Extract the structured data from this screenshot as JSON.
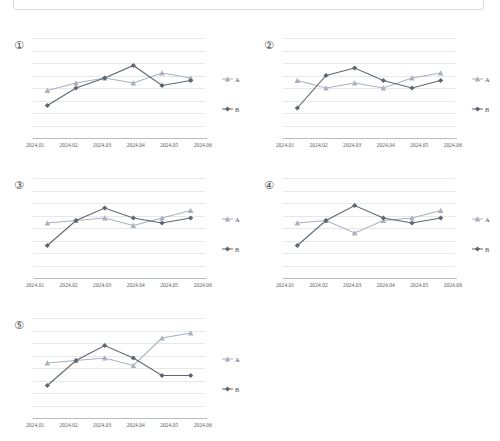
{
  "page": {
    "background": "#ffffff",
    "top_panel": {
      "name": "cropped-panel"
    }
  },
  "legend": {
    "series_a_label": "A",
    "series_b_label": "B"
  },
  "colors": {
    "series_a": "#a9b1bd",
    "series_b": "#5e6671",
    "gridline": "#e6e8ea",
    "axis": "#b9bcc0",
    "text": "#56565a"
  },
  "chart_data": [
    {
      "id": "chart-1",
      "index_label": "①",
      "type": "line",
      "title": "",
      "xlabel": "",
      "ylabel": "",
      "grid": true,
      "legend_position": "right",
      "categories": [
        "2024.01",
        "2024.02",
        "2024.03",
        "2024.04",
        "2024.05",
        "2024.06"
      ],
      "ylim": [
        0,
        100
      ],
      "series": [
        {
          "name": "A",
          "marker": "triangle",
          "values": [
            74,
            77,
            79,
            77,
            81,
            79
          ]
        },
        {
          "name": "B",
          "marker": "diamond",
          "values": [
            68,
            75,
            79,
            84,
            76,
            78
          ]
        }
      ]
    },
    {
      "id": "chart-2",
      "index_label": "②",
      "type": "line",
      "title": "",
      "xlabel": "",
      "ylabel": "",
      "grid": true,
      "legend_position": "right",
      "categories": [
        "2024.01",
        "2024.02",
        "2024.03",
        "2024.04",
        "2024.05",
        "2024.06"
      ],
      "ylim": [
        0,
        100
      ],
      "series": [
        {
          "name": "A",
          "marker": "triangle",
          "values": [
            78,
            75,
            77,
            75,
            79,
            81
          ]
        },
        {
          "name": "B",
          "marker": "diamond",
          "values": [
            67,
            80,
            83,
            78,
            75,
            78
          ]
        }
      ]
    },
    {
      "id": "chart-3",
      "index_label": "③",
      "type": "line",
      "title": "",
      "xlabel": "",
      "ylabel": "",
      "grid": true,
      "legend_position": "right",
      "categories": [
        "2024.01",
        "2024.02",
        "2024.03",
        "2024.04",
        "2024.05",
        "2024.06"
      ],
      "ylim": [
        0,
        100
      ],
      "series": [
        {
          "name": "A",
          "marker": "triangle",
          "values": [
            77,
            78,
            79,
            76,
            79,
            82
          ]
        },
        {
          "name": "B",
          "marker": "diamond",
          "values": [
            68,
            78,
            83,
            79,
            77,
            79
          ]
        }
      ]
    },
    {
      "id": "chart-4",
      "index_label": "④",
      "type": "line",
      "title": "",
      "xlabel": "",
      "ylabel": "",
      "grid": true,
      "legend_position": "right",
      "categories": [
        "2024.01",
        "2024.02",
        "2024.03",
        "2024.04",
        "2024.05",
        "2024.06"
      ],
      "ylim": [
        0,
        100
      ],
      "series": [
        {
          "name": "A",
          "marker": "triangle",
          "values": [
            77,
            78,
            73,
            78,
            79,
            82
          ]
        },
        {
          "name": "B",
          "marker": "diamond",
          "values": [
            68,
            78,
            84,
            79,
            77,
            79
          ]
        }
      ]
    },
    {
      "id": "chart-5",
      "index_label": "⑤",
      "type": "line",
      "title": "",
      "xlabel": "",
      "ylabel": "",
      "grid": true,
      "legend_position": "right",
      "categories": [
        "2024.01",
        "2024.02",
        "2024.03",
        "2024.04",
        "2024.05",
        "2024.06"
      ],
      "ylim": [
        0,
        100
      ],
      "series": [
        {
          "name": "A",
          "marker": "triangle",
          "values": [
            77,
            78,
            79,
            76,
            87,
            89
          ]
        },
        {
          "name": "B",
          "marker": "diamond",
          "values": [
            68,
            78,
            84,
            79,
            72,
            72
          ]
        }
      ]
    }
  ]
}
